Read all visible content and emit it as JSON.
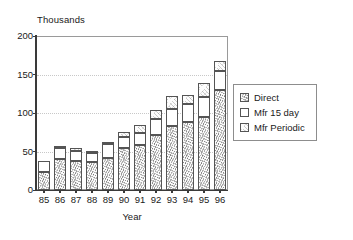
{
  "chart_data": {
    "type": "bar",
    "subtype": "stacked-bar",
    "title": "",
    "xlabel": "Year",
    "ylabel": "Thousands",
    "ylim": [
      0,
      200
    ],
    "yticks": [
      0,
      50,
      100,
      150,
      200
    ],
    "grid": true,
    "grid_style": "dotted-horizontal",
    "legend_position": "right",
    "categories": [
      "85",
      "86",
      "87",
      "88",
      "89",
      "90",
      "91",
      "92",
      "93",
      "94",
      "95",
      "96"
    ],
    "series": [
      {
        "name": "Direct",
        "values": [
          24,
          40,
          38,
          36,
          42,
          55,
          58,
          72,
          83,
          88,
          95,
          130
        ]
      },
      {
        "name": "Mfr 15 day",
        "values": [
          14,
          14,
          13,
          12,
          18,
          14,
          16,
          20,
          22,
          24,
          26,
          24
        ]
      },
      {
        "name": "Mfr Periodic",
        "values": [
          0,
          2,
          3,
          2,
          3,
          6,
          11,
          12,
          17,
          11,
          18,
          14
        ]
      }
    ],
    "totals": [
      38,
      56,
      54,
      50,
      63,
      75,
      85,
      104,
      122,
      123,
      139,
      168
    ]
  },
  "legend": {
    "items": [
      {
        "label": "Direct",
        "swatch": "stipple-dense"
      },
      {
        "label": "Mfr 15 day",
        "swatch": "white"
      },
      {
        "label": "Mfr Periodic",
        "swatch": "stipple-light"
      }
    ]
  },
  "axes": {
    "y_title": "Thousands",
    "x_title": "Year"
  }
}
